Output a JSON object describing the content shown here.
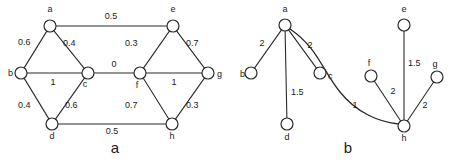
{
  "figure": {
    "background_color": "#ffffff",
    "stroke_color": "#2b2b2b",
    "text_color": "#1a1a1a",
    "panels": [
      {
        "caption": "a",
        "caption_x": 115,
        "caption_y": 153
      },
      {
        "caption": "b",
        "caption_x": 348,
        "caption_y": 153
      }
    ]
  },
  "chart_data": {
    "type": "diagram",
    "subtype": "weighted-undirected-graph-pair",
    "title": "",
    "panels": [
      {
        "id": "a",
        "caption": "a",
        "nodes": [
          {
            "id": "a",
            "label": "a",
            "x": 50,
            "y": 26,
            "r": 6,
            "label_x": 50,
            "label_y": 12,
            "label_anchor": "middle"
          },
          {
            "id": "b",
            "label": "b",
            "x": 21,
            "y": 73,
            "r": 6,
            "label_x": 8,
            "label_y": 76,
            "label_anchor": "start"
          },
          {
            "id": "c",
            "label": "c",
            "x": 88,
            "y": 73,
            "r": 6,
            "label_x": 85,
            "label_y": 87,
            "label_anchor": "middle"
          },
          {
            "id": "d",
            "label": "d",
            "x": 52,
            "y": 124,
            "r": 6,
            "label_x": 52,
            "label_y": 139,
            "label_anchor": "middle"
          },
          {
            "id": "e",
            "label": "e",
            "x": 173,
            "y": 26,
            "r": 6,
            "label_x": 173,
            "label_y": 12,
            "label_anchor": "middle"
          },
          {
            "id": "f",
            "label": "f",
            "x": 140,
            "y": 73,
            "r": 6,
            "label_x": 137,
            "label_y": 88,
            "label_anchor": "middle"
          },
          {
            "id": "g",
            "label": "g",
            "x": 208,
            "y": 73,
            "r": 6,
            "label_x": 217,
            "label_y": 77,
            "label_anchor": "start"
          },
          {
            "id": "h",
            "label": "h",
            "x": 172,
            "y": 124,
            "r": 6,
            "label_x": 172,
            "label_y": 139,
            "label_anchor": "middle"
          }
        ],
        "edges": [
          {
            "from": "a",
            "to": "e",
            "weight": "0.5",
            "label_x": 111,
            "label_y": 19,
            "label_anchor": "middle"
          },
          {
            "from": "a",
            "to": "b",
            "weight": "0.6",
            "label_x": 18,
            "label_y": 45,
            "label_anchor": "start"
          },
          {
            "from": "a",
            "to": "c",
            "weight": "0.4",
            "label_x": 63,
            "label_y": 46,
            "label_anchor": "start"
          },
          {
            "from": "b",
            "to": "c",
            "weight": "1",
            "label_x": 53,
            "label_y": 85,
            "label_anchor": "middle"
          },
          {
            "from": "b",
            "to": "d",
            "weight": "0.4",
            "label_x": 18,
            "label_y": 108,
            "label_anchor": "start"
          },
          {
            "from": "c",
            "to": "d",
            "weight": "0.6",
            "label_x": 65,
            "label_y": 108,
            "label_anchor": "start"
          },
          {
            "from": "c",
            "to": "f",
            "weight": "0",
            "label_x": 114,
            "label_y": 67,
            "label_anchor": "middle"
          },
          {
            "from": "e",
            "to": "f",
            "weight": "0.3",
            "label_x": 125,
            "label_y": 46,
            "label_anchor": "start"
          },
          {
            "from": "e",
            "to": "g",
            "weight": "0.7",
            "label_x": 186,
            "label_y": 46,
            "label_anchor": "start"
          },
          {
            "from": "f",
            "to": "g",
            "weight": "1",
            "label_x": 174,
            "label_y": 85,
            "label_anchor": "middle"
          },
          {
            "from": "f",
            "to": "h",
            "weight": "0.7",
            "label_x": 125,
            "label_y": 108,
            "label_anchor": "start"
          },
          {
            "from": "g",
            "to": "h",
            "weight": "0.3",
            "label_x": 186,
            "label_y": 108,
            "label_anchor": "start"
          },
          {
            "from": "d",
            "to": "h",
            "weight": "0.5",
            "label_x": 112,
            "label_y": 134,
            "label_anchor": "middle"
          }
        ]
      },
      {
        "id": "b",
        "caption": "b",
        "nodes": [
          {
            "id": "a",
            "label": "a",
            "x": 285,
            "y": 25,
            "r": 6,
            "label_x": 285,
            "label_y": 12,
            "label_anchor": "middle"
          },
          {
            "id": "b",
            "label": "b",
            "x": 251,
            "y": 73,
            "r": 6,
            "label_x": 240,
            "label_y": 77,
            "label_anchor": "start"
          },
          {
            "id": "c",
            "label": "c",
            "x": 320,
            "y": 73,
            "r": 6,
            "label_x": 328,
            "label_y": 79,
            "label_anchor": "start"
          },
          {
            "id": "d",
            "label": "d",
            "x": 287,
            "y": 124,
            "r": 6,
            "label_x": 287,
            "label_y": 140,
            "label_anchor": "middle"
          },
          {
            "id": "e",
            "label": "e",
            "x": 404,
            "y": 25,
            "r": 6,
            "label_x": 404,
            "label_y": 12,
            "label_anchor": "middle"
          },
          {
            "id": "f",
            "label": "f",
            "x": 371,
            "y": 76,
            "r": 6,
            "label_x": 369,
            "label_y": 66,
            "label_anchor": "middle"
          },
          {
            "id": "g",
            "label": "g",
            "x": 437,
            "y": 77,
            "r": 6,
            "label_x": 435,
            "label_y": 67,
            "label_anchor": "middle"
          },
          {
            "id": "h",
            "label": "h",
            "x": 404,
            "y": 126,
            "r": 6,
            "label_x": 404,
            "label_y": 141,
            "label_anchor": "middle"
          }
        ],
        "edges": [
          {
            "from": "a",
            "to": "b",
            "weight": "2",
            "label_x": 262,
            "label_y": 46,
            "label_anchor": "middle",
            "curved": false
          },
          {
            "from": "a",
            "to": "d",
            "weight": "1.5",
            "label_x": 291,
            "label_y": 95,
            "label_anchor": "start",
            "curved": false
          },
          {
            "from": "a",
            "to": "c",
            "weight": "2",
            "label_x": 310,
            "label_y": 48,
            "label_anchor": "middle",
            "curved": false
          },
          {
            "from": "a",
            "to": "h",
            "weight": "1",
            "label_x": 355,
            "label_y": 108,
            "label_anchor": "middle",
            "curved": true,
            "path": "M 290 29 C 318 48 322 70 340 92 C 356 112 378 122 399 124"
          },
          {
            "from": "f",
            "to": "h",
            "weight": "2",
            "label_x": 393,
            "label_y": 94,
            "label_anchor": "middle",
            "curved": false
          },
          {
            "from": "e",
            "to": "h",
            "weight": "1.5",
            "label_x": 408,
            "label_y": 66,
            "label_anchor": "start",
            "curved": false
          },
          {
            "from": "g",
            "to": "h",
            "weight": "2",
            "label_x": 425,
            "label_y": 108,
            "label_anchor": "middle",
            "curved": false
          }
        ]
      }
    ]
  }
}
